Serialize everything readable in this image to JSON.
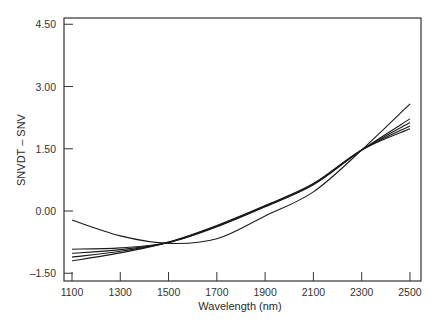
{
  "chart_data": {
    "type": "line",
    "title": "",
    "xlabel": "Wavelength (nm)",
    "ylabel": "SNVDT – SNV",
    "xlim": [
      1060,
      2550
    ],
    "ylim": [
      -1.65,
      4.65
    ],
    "x_ticks": [
      1100,
      1300,
      1500,
      1700,
      1900,
      2100,
      2300,
      2500
    ],
    "x_tick_labels": [
      "1100",
      "1300",
      "1500",
      "1700",
      "1900",
      "2100",
      "2300",
      "2500"
    ],
    "y_ticks": [
      4.5,
      3.0,
      1.5,
      0.0,
      -1.5
    ],
    "y_tick_labels": [
      "4.50",
      "3.00",
      "1.50",
      "0.00",
      "–1.50"
    ],
    "grid": false,
    "legend": null,
    "x": [
      1100,
      1300,
      1500,
      1700,
      1900,
      2100,
      2300,
      2500
    ],
    "series": [
      {
        "name": "curve-1",
        "values": [
          -0.22,
          -0.6,
          -0.78,
          -0.67,
          -0.12,
          0.46,
          1.47,
          2.58
        ]
      },
      {
        "name": "curve-2",
        "values": [
          -0.92,
          -0.89,
          -0.76,
          -0.38,
          0.1,
          0.63,
          1.47,
          2.22
        ]
      },
      {
        "name": "curve-3",
        "values": [
          -1.02,
          -0.93,
          -0.76,
          -0.37,
          0.11,
          0.64,
          1.47,
          2.13
        ]
      },
      {
        "name": "curve-4",
        "values": [
          -1.11,
          -0.97,
          -0.75,
          -0.36,
          0.12,
          0.65,
          1.47,
          2.05
        ]
      },
      {
        "name": "curve-5",
        "values": [
          -1.2,
          -1.01,
          -0.75,
          -0.35,
          0.13,
          0.66,
          1.47,
          1.98
        ]
      }
    ],
    "line_color": "#1a1a1a"
  }
}
